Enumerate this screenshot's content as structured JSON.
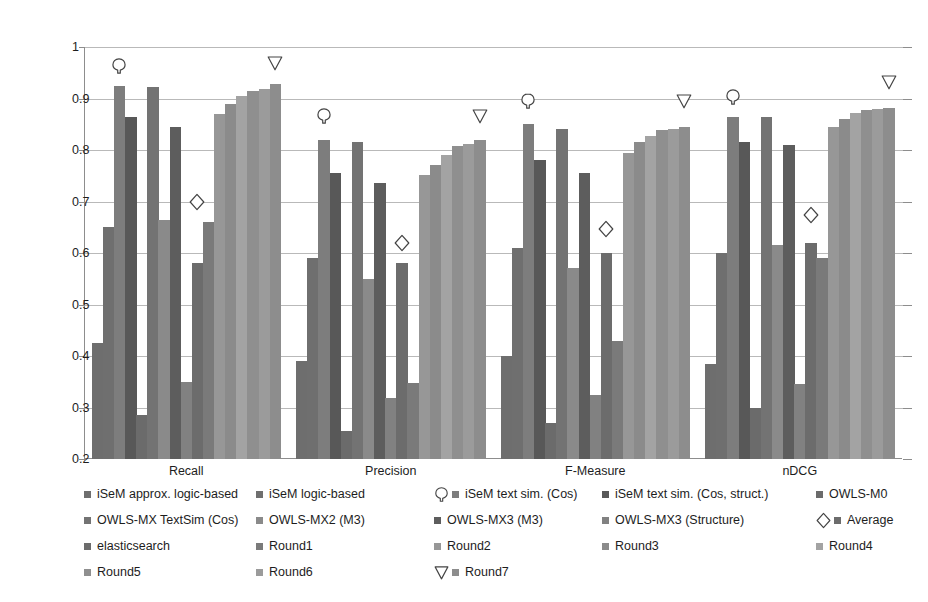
{
  "chart_data": {
    "type": "bar",
    "title": "",
    "xlabel": "",
    "ylabel": "",
    "ylim": [
      0.2,
      1.0
    ],
    "ytick_labels": [
      "1",
      "0.9",
      "0.8",
      "0.7",
      "0.6",
      "0.5",
      "0.4",
      "0.3",
      "0.2"
    ],
    "ytick_values": [
      1,
      0.9,
      0.8,
      0.7,
      0.6,
      0.5,
      0.4,
      0.3,
      0.2
    ],
    "grid": true,
    "legend_position": "bottom",
    "categories": [
      "Recall",
      "Precision",
      "F-Measure",
      "nDCG"
    ],
    "series": [
      {
        "name": "iSeM approx. logic-based",
        "color": "#6e6e6e",
        "values": [
          0.425,
          0.39,
          0.4,
          0.385
        ]
      },
      {
        "name": "iSeM logic-based",
        "color": "#6f6f6f",
        "values": [
          0.65,
          0.59,
          0.61,
          0.6
        ]
      },
      {
        "name": "iSeM text sim. (Cos)",
        "color": "#7d7d7d",
        "values": [
          0.925,
          0.82,
          0.85,
          0.865
        ]
      },
      {
        "name": "iSeM text sim. (Cos, struct.)",
        "color": "#585858",
        "values": [
          0.865,
          0.755,
          0.78,
          0.815
        ]
      },
      {
        "name": "OWLS-M0",
        "color": "#6b6b6b",
        "values": [
          0.285,
          0.255,
          0.27,
          0.3
        ]
      },
      {
        "name": "OWLS-MX TextSim (Cos)",
        "color": "#737373",
        "values": [
          0.922,
          0.815,
          0.84,
          0.865
        ]
      },
      {
        "name": "OWLS-MX2 (M3)",
        "color": "#8a8a8a",
        "values": [
          0.665,
          0.55,
          0.57,
          0.615
        ]
      },
      {
        "name": "OWLS-MX3 (M3)",
        "color": "#5d5d5d",
        "values": [
          0.845,
          0.735,
          0.755,
          0.81
        ]
      },
      {
        "name": "OWLS-MX3 (Structure)",
        "color": "#818181",
        "values": [
          0.35,
          0.318,
          0.325,
          0.345
        ]
      },
      {
        "name": "elasticsearch",
        "color": "#6c6c6c",
        "values": [
          0.58,
          0.58,
          0.6,
          0.62
        ]
      },
      {
        "name": "Round1",
        "color": "#7a7a7a",
        "values": [
          0.66,
          0.348,
          0.43,
          0.59
        ]
      },
      {
        "name": "Round2",
        "color": "#979797",
        "values": [
          0.87,
          0.752,
          0.795,
          0.845
        ]
      },
      {
        "name": "Round3",
        "color": "#8b8b8b",
        "values": [
          0.89,
          0.77,
          0.815,
          0.86
        ]
      },
      {
        "name": "Round4",
        "color": "#a3a3a3",
        "values": [
          0.905,
          0.79,
          0.828,
          0.872
        ]
      },
      {
        "name": "Round5",
        "color": "#8f8f8f",
        "values": [
          0.915,
          0.808,
          0.838,
          0.878
        ]
      },
      {
        "name": "Round6",
        "color": "#9b9b9b",
        "values": [
          0.918,
          0.812,
          0.84,
          0.88
        ]
      },
      {
        "name": "Round7",
        "color": "#8d8d8d",
        "values": [
          0.928,
          0.82,
          0.845,
          0.882
        ]
      }
    ],
    "annotations": [
      {
        "label": "iSeM text sim. (Cos)",
        "shape": "balloon",
        "category": "Recall",
        "value": 0.96
      },
      {
        "label": "Average",
        "shape": "diamond",
        "category": "Recall",
        "value": 0.695
      },
      {
        "label": "Round7",
        "shape": "triangle",
        "category": "Recall",
        "value": 0.965
      },
      {
        "label": "iSeM text sim. (Cos)",
        "shape": "balloon",
        "category": "Precision",
        "value": 0.862
      },
      {
        "label": "Average",
        "shape": "diamond",
        "category": "Precision",
        "value": 0.615
      },
      {
        "label": "Round7",
        "shape": "triangle",
        "category": "Precision",
        "value": 0.862
      },
      {
        "label": "iSeM text sim. (Cos)",
        "shape": "balloon",
        "category": "F-Measure",
        "value": 0.892
      },
      {
        "label": "Average",
        "shape": "diamond",
        "category": "F-Measure",
        "value": 0.642
      },
      {
        "label": "Round7",
        "shape": "triangle",
        "category": "F-Measure",
        "value": 0.892
      },
      {
        "label": "iSeM text sim. (Cos)",
        "shape": "balloon",
        "category": "nDCG",
        "value": 0.9
      },
      {
        "label": "Average",
        "shape": "diamond",
        "category": "nDCG",
        "value": 0.67
      },
      {
        "label": "Round7",
        "shape": "triangle",
        "category": "nDCG",
        "value": 0.928
      }
    ]
  },
  "legend": {
    "rows": [
      [
        {
          "label": "iSeM approx. logic-based",
          "swatch": "#6e6e6e",
          "shape": null
        },
        {
          "label": "iSeM logic-based",
          "swatch": "#6f6f6f",
          "shape": null
        },
        {
          "label": "iSeM text sim. (Cos)",
          "swatch": "#7d7d7d",
          "shape": "balloon"
        },
        {
          "label": "iSeM text sim. (Cos, struct.)",
          "swatch": "#585858",
          "shape": null
        },
        {
          "label": "OWLS-M0",
          "swatch": "#6b6b6b",
          "shape": null
        }
      ],
      [
        {
          "label": "OWLS-MX TextSim (Cos)",
          "swatch": "#737373",
          "shape": null
        },
        {
          "label": "OWLS-MX2 (M3)",
          "swatch": "#8a8a8a",
          "shape": null
        },
        {
          "label": "OWLS-MX3 (M3)",
          "swatch": "#5d5d5d",
          "shape": null
        },
        {
          "label": "OWLS-MX3 (Structure)",
          "swatch": "#818181",
          "shape": null
        },
        {
          "label": "Average",
          "swatch": "#6c6c6c",
          "shape": "diamond"
        }
      ],
      [
        {
          "label": "elasticsearch",
          "swatch": "#6c6c6c",
          "shape": null
        },
        {
          "label": "Round1",
          "swatch": "#7a7a7a",
          "shape": null
        },
        {
          "label": "Round2",
          "swatch": "#979797",
          "shape": null
        },
        {
          "label": "Round3",
          "swatch": "#8b8b8b",
          "shape": null
        },
        {
          "label": "Round4",
          "swatch": "#a3a3a3",
          "shape": null
        }
      ],
      [
        {
          "label": "Round5",
          "swatch": "#8f8f8f",
          "shape": null
        },
        {
          "label": "Round6",
          "swatch": "#9b9b9b",
          "shape": null
        },
        {
          "label": "Round7",
          "swatch": "#8d8d8d",
          "shape": "triangle"
        }
      ]
    ]
  },
  "colors": {
    "axis": "#8d8d8d",
    "grid": "#b9b9b9",
    "text": "#1d1d1d",
    "background": "#ffffff",
    "marker_stroke": "#444444"
  }
}
